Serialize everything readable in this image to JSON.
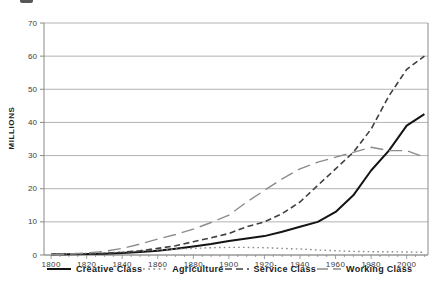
{
  "canvas": {
    "width": 438,
    "height": 283,
    "background": "#ffffff"
  },
  "artifact": {
    "note": "partially-cropped text fragment at top edge"
  },
  "chart_data": {
    "type": "line",
    "title": "",
    "xlabel": "",
    "ylabel": "MILLIONS",
    "xlim": [
      1796,
      2012
    ],
    "ylim": [
      0,
      70
    ],
    "grid": "horizontal",
    "legend_position": "bottom",
    "xticks": [
      1800,
      1820,
      1840,
      1860,
      1880,
      1900,
      1920,
      1940,
      1960,
      1980,
      2000
    ],
    "xtick_minor_step": 5,
    "yticks": [
      0,
      10,
      20,
      30,
      40,
      50,
      60,
      70
    ],
    "x": [
      1800,
      1810,
      1820,
      1830,
      1840,
      1850,
      1860,
      1870,
      1880,
      1890,
      1900,
      1910,
      1920,
      1930,
      1940,
      1950,
      1960,
      1970,
      1980,
      1990,
      2000,
      2010
    ],
    "series": [
      {
        "name": "Creative Class",
        "dash": "solid",
        "color": "#141414",
        "width": 2,
        "values": [
          0.2,
          0.2,
          0.3,
          0.4,
          0.6,
          0.9,
          1.3,
          1.9,
          2.6,
          3.3,
          4.2,
          5,
          5.7,
          7,
          8.5,
          10,
          13,
          18,
          25.5,
          31.5,
          39,
          42.5
        ]
      },
      {
        "name": "Agriculture",
        "dash": "dotted",
        "color": "#8a8a8a",
        "width": 1.4,
        "values": [
          0.3,
          0.4,
          0.5,
          0.7,
          0.9,
          1.2,
          1.5,
          1.8,
          2,
          2.2,
          2.3,
          2.3,
          2.2,
          2,
          1.8,
          1.5,
          1.3,
          1.1,
          1,
          1,
          0.9,
          0.8
        ]
      },
      {
        "name": "Service Class",
        "dash": "dashed",
        "color": "#3f3f3f",
        "width": 1.6,
        "values": [
          0.1,
          0.2,
          0.3,
          0.5,
          0.8,
          1.3,
          2,
          2.8,
          4,
          5.2,
          6.5,
          8.5,
          10,
          12.5,
          16,
          21,
          26,
          31,
          38,
          48,
          56,
          60
        ]
      },
      {
        "name": "Working Class",
        "dash": "longdash",
        "color": "#8c8c8c",
        "width": 1.4,
        "values": [
          0.1,
          0.3,
          0.6,
          1.1,
          2,
          3.3,
          4.8,
          6.2,
          7.8,
          9.8,
          12,
          16,
          19.5,
          23,
          26,
          28,
          29.5,
          31,
          32.5,
          31.5,
          31.5,
          29.5
        ]
      }
    ],
    "style": {
      "grid_color": "#aaaaaa",
      "frame_color": "#8a8a8a",
      "tick_label_color": "#3c3c3c",
      "plot": {
        "left": 44,
        "right": 428,
        "top": 23,
        "bottom": 255
      }
    }
  }
}
